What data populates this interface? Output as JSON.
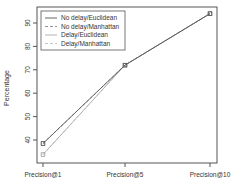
{
  "chart_data": {
    "type": "line",
    "title": "",
    "xlabel": "",
    "ylabel": "Percentage",
    "categories": [
      "Precision@1",
      "Precision@5",
      "Precision@10"
    ],
    "y_ticks": [
      40,
      50,
      60,
      70,
      80,
      90
    ],
    "ylim": [
      33,
      96
    ],
    "grid": false,
    "legend_position": "top-left",
    "series": [
      {
        "name": "No delay/Euclidean",
        "values": [
          38.5,
          72,
          94
        ],
        "color": "#555555",
        "dash": "",
        "marker": "square"
      },
      {
        "name": "No delay/Manhattan",
        "values": [
          38.5,
          72,
          94
        ],
        "color": "#888888",
        "dash": "3,2",
        "marker": "square"
      },
      {
        "name": "Delay/Euclidean",
        "values": [
          33.8,
          72,
          94
        ],
        "color": "#aaaaaa",
        "dash": "",
        "marker": "square"
      },
      {
        "name": "Delay/Manhattan",
        "values": [
          33.8,
          72,
          94
        ],
        "color": "#c0c0c0",
        "dash": "3,2",
        "marker": "square"
      }
    ]
  }
}
